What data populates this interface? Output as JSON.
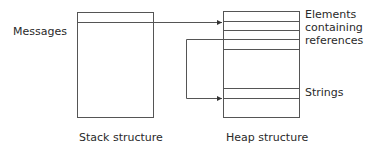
{
  "diagram": {
    "stack": {
      "side_label": "Messages",
      "caption": "Stack structure"
    },
    "heap": {
      "caption": "Heap structure",
      "annotations": {
        "elements_line1": "Elements",
        "elements_line2": "containing",
        "elements_line3": "references",
        "strings": "Strings"
      }
    },
    "colors": {
      "line": "#555555",
      "text": "#2a2a2a",
      "background": "#ffffff"
    }
  }
}
